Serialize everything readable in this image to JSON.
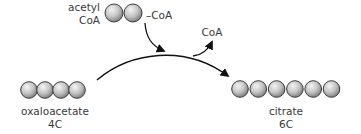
{
  "diagram": {
    "colors": {
      "sphere_light": "#f4f4f4",
      "sphere_mid": "#c4c4c4",
      "sphere_dark": "#7d7d7d",
      "sphere_outline": "#3c3c3c",
      "arrow": "#111111",
      "text": "#3a3a3a"
    },
    "acetyl_coa": {
      "label_line1": "acetyl",
      "label_line2": "CoA",
      "attachment_label": "–CoA",
      "carbons": 2
    },
    "oxaloacetate": {
      "name": "oxaloacetate",
      "carbon_label": "4C",
      "carbons": 4
    },
    "citrate": {
      "name": "citrate",
      "carbon_label": "6C",
      "carbons": 6
    },
    "released": {
      "label": "CoA"
    },
    "edges": [
      {
        "from": "oxaloacetate",
        "to": "citrate",
        "kind": "main-reaction"
      },
      {
        "from": "acetyl_coa",
        "to": "main-reaction",
        "kind": "input"
      },
      {
        "from": "main-reaction",
        "to": "CoA",
        "kind": "output"
      }
    ]
  }
}
